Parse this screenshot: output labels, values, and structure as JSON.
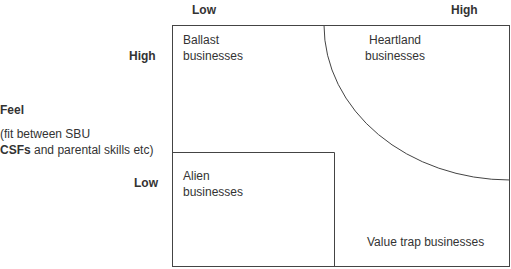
{
  "x_axis": {
    "low_label": "Low",
    "high_label": "High"
  },
  "y_axis": {
    "high_label": "High",
    "low_label": "Low",
    "title": "Feel",
    "subtitle_line1": "(fit between SBU",
    "subtitle_line2_bold": "CSFs",
    "subtitle_line2_rest": " and parental skills etc)"
  },
  "quadrants": {
    "ballast": {
      "line1": "Ballast",
      "line2": "businesses"
    },
    "heartland": {
      "line1": "Heartland",
      "line2": "businesses"
    },
    "alien": {
      "line1": "Alien",
      "line2": "businesses"
    },
    "value_trap": {
      "label": "Value trap businesses"
    }
  },
  "colors": {
    "line": "#333333",
    "text": "#333333",
    "background": "#ffffff"
  }
}
